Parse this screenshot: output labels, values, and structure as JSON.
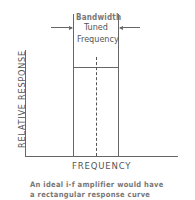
{
  "diagram": {
    "bandwidth_label": "Bandwidth",
    "tuned_label_line1": "Tuned",
    "tuned_label_line2": "Frequency",
    "y_axis_label": "RELATIVE RESPONSE",
    "x_axis_label": "FREQUENCY",
    "caption_line1": "An ideal i-f amplifier would have",
    "caption_line2": "a rectangular response curve"
  }
}
